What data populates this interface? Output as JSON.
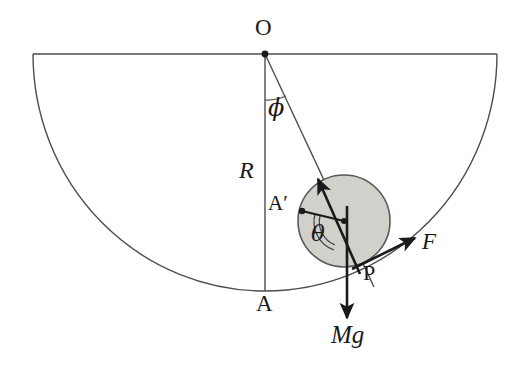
{
  "figure": {
    "background_color": "#ffffff",
    "line_color": "#4d4d4d",
    "vector_color": "#1a1a1a",
    "ball_fill_color": "#d2d0cb",
    "ball_stroke_color": "#595959",
    "label_color": "#1a1a1a"
  },
  "labels": {
    "center_point": "O",
    "bowl_bottom": "A",
    "ball_contact_reference": "A′",
    "contact_point": "P",
    "bowl_radius": "R",
    "applied_force": "F",
    "weight": "Mg",
    "bowl_angle": "ϕ",
    "roll_angle": "θ"
  },
  "geometry": {
    "bowl": {
      "center_x": 265,
      "center_y": 54,
      "semi_x": 232,
      "semi_y": 237,
      "rim_left_x": 33,
      "rim_right_x": 497,
      "rim_y": 54,
      "bottom_y": 291
    },
    "ball": {
      "center_x": 344,
      "center_y": 221,
      "radius": 46
    },
    "points": {
      "O": {
        "x": 265,
        "y": 54
      },
      "A": {
        "x": 265,
        "y": 291
      },
      "A_prime": {
        "x": 302,
        "y": 211
      },
      "P": {
        "x": 357,
        "y": 266
      },
      "ball_center": {
        "x": 344,
        "y": 221
      }
    },
    "vectors": {
      "OP_radial": {
        "x1": 265,
        "y1": 54,
        "x2": 372,
        "y2": 283
      },
      "normal_arrow": {
        "x1": 357,
        "y1": 266,
        "x2": 318,
        "y2": 178
      },
      "force_F": {
        "x1": 357,
        "y1": 266,
        "x2": 414,
        "y2": 238
      },
      "weight_Mg": {
        "x1": 347,
        "y1": 210,
        "x2": 347,
        "y2": 320
      },
      "radius_to_A_prime": {
        "x1": 344,
        "y1": 221,
        "x2": 302,
        "y2": 211
      }
    },
    "angles": {
      "phi_degrees": 25,
      "theta_degrees": 104
    }
  }
}
